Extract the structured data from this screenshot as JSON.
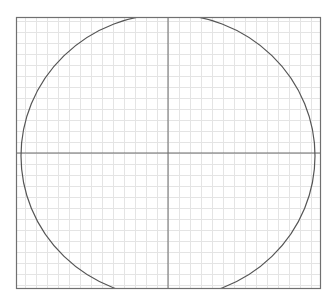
{
  "diagram": {
    "type": "circle-on-grid",
    "frame": {
      "x": 16,
      "y": 17,
      "width": 305,
      "height": 272,
      "stroke": "#707070"
    },
    "grid": {
      "spacing": 11,
      "color": "#e4e4e4"
    },
    "axes": {
      "cx": 168,
      "cy": 153,
      "color": "#6a6a6a"
    },
    "shape": {
      "kind": "ellipse",
      "cx": 168,
      "cy": 156,
      "rx": 147,
      "ry": 142,
      "stroke": "#555555"
    },
    "colors": {
      "background": "#ffffff",
      "grid": "#e4e4e4",
      "frame": "#707070",
      "curve": "#555555",
      "axis": "#6a6a6a"
    }
  }
}
